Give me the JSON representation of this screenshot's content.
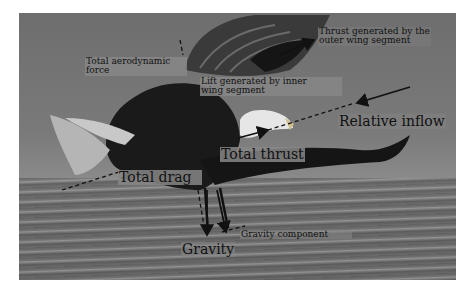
{
  "figure": {
    "labels": {
      "thrust_outer_line1": "Thrust generated by the",
      "thrust_outer_line2": "outer wing segment",
      "total_aero_line1": "Total aerodynamic",
      "total_aero_line2": "force",
      "lift_inner_line1": "Lift generated by inner",
      "lift_inner_line2": "wing segment",
      "relative_inflow": "Relative inflow",
      "total_thrust": "Total thrust",
      "total_drag": "Total drag",
      "gravity_component": "Gravity component",
      "gravity": "Gravity"
    },
    "colors": {
      "background": "#ffffff",
      "label_box": "#878787",
      "text": "#111111",
      "eagle_body": "#1a1a1a",
      "eagle_head": "#e6e6e6"
    }
  }
}
